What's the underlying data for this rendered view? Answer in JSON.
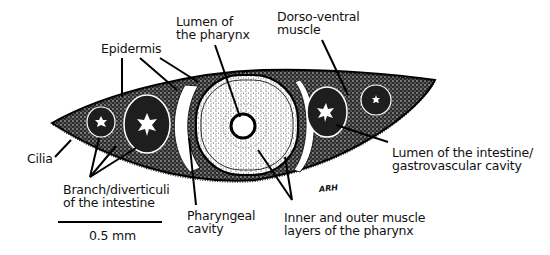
{
  "figure": {
    "labels": {
      "lumen_pharynx": "Lumen of\nthe pharynx",
      "dorso_ventral": "Dorso-ventral\nmuscle",
      "epidermis": "Epidermis",
      "cilia": "Cilia",
      "branch_intestine": "Branch/diverticuli\nof the intestine",
      "pharyngeal_cavity": "Pharyngeal\ncavity",
      "muscle_layers": "Inner and outer muscle\nlayers of the pharynx",
      "lumen_intestine": "Lumen of the intestine/\ngastrovascular cavity"
    },
    "scale_bar": {
      "label": "0.5 mm"
    },
    "signature": "ARH"
  }
}
